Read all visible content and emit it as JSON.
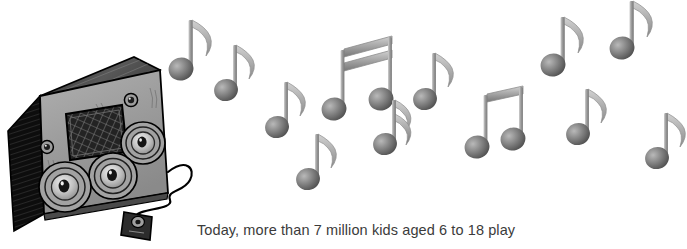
{
  "page": {
    "background_color": "#ffffff",
    "width": 687,
    "height": 249
  },
  "caption": {
    "text": "Today, more than 7 million kids aged 6 to 18 play",
    "color": "#3b3b3b"
  },
  "illustration": {
    "title": "boombox-with-music-notes",
    "style": "grayscale hand-drawn line art",
    "palette": {
      "body": "#9a9a9a",
      "body_dark": "#111111",
      "body_top": "#6f6f6f",
      "outline": "#000000",
      "note": "#8f8f8f",
      "note_head_dark": "#5e5e5e",
      "note_stem": "#a8a8a8",
      "grille": "#2b2b2b",
      "cord": "#000000",
      "mic": "#2a2a2a"
    },
    "boombox": {
      "name": "boombox",
      "speakers": [
        {
          "name": "speaker-left",
          "cx": 65,
          "cy": 186,
          "r": 27
        },
        {
          "name": "speaker-center",
          "cx": 113,
          "cy": 175,
          "r": 25
        },
        {
          "name": "speaker-right",
          "cx": 143,
          "cy": 143,
          "r": 23
        }
      ],
      "knobs": [
        {
          "name": "knob-upper-right",
          "cx": 131,
          "cy": 100,
          "r": 6
        },
        {
          "name": "knob-lower-left",
          "cx": 47,
          "cy": 146,
          "r": 6
        }
      ],
      "grille": {
        "name": "mesh-grille",
        "x": 66,
        "y": 111,
        "w": 54,
        "h": 45
      },
      "cord": {
        "name": "power-cord"
      },
      "microphone": {
        "name": "microphone-plug",
        "cx": 138,
        "cy": 226
      }
    },
    "notes": [
      {
        "name": "note-1",
        "type": "eighth",
        "head_x": 181,
        "head_y": 69,
        "stem_h": 48,
        "scale": 1.0
      },
      {
        "name": "note-2",
        "type": "eighth",
        "head_x": 226,
        "head_y": 90,
        "stem_h": 44,
        "scale": 0.95
      },
      {
        "name": "note-3",
        "type": "eighth",
        "head_x": 277,
        "head_y": 127,
        "stem_h": 45,
        "scale": 0.95
      },
      {
        "name": "note-4",
        "type": "eighth",
        "head_x": 308,
        "head_y": 179,
        "stem_h": 45,
        "scale": 0.95
      },
      {
        "name": "note-5-beam-pair",
        "type": "beamed-sixteenth-pair",
        "head_x": 334,
        "head_y": 108,
        "head2_x": 381,
        "head2_y": 99,
        "stem_h": 62,
        "scale": 1.0
      },
      {
        "name": "note-6",
        "type": "sixteenth",
        "head_x": 385,
        "head_y": 144,
        "stem_h": 48,
        "scale": 0.95
      },
      {
        "name": "note-7",
        "type": "eighth",
        "head_x": 425,
        "head_y": 99,
        "stem_h": 47,
        "scale": 0.95
      },
      {
        "name": "note-8-beam-pair",
        "type": "beamed-eighth-pair",
        "head_x": 477,
        "head_y": 146,
        "head2_x": 513,
        "head2_y": 139,
        "stem_h": 58,
        "scale": 1.0
      },
      {
        "name": "note-9",
        "type": "eighth",
        "head_x": 553,
        "head_y": 65,
        "stem_h": 48,
        "scale": 1.0
      },
      {
        "name": "note-10",
        "type": "eighth",
        "head_x": 622,
        "head_y": 48,
        "stem_h": 49,
        "scale": 1.0
      },
      {
        "name": "note-11",
        "type": "eighth",
        "head_x": 578,
        "head_y": 134,
        "stem_h": 47,
        "scale": 0.95
      },
      {
        "name": "note-12",
        "type": "eighth",
        "head_x": 657,
        "head_y": 158,
        "stem_h": 47,
        "scale": 0.95
      }
    ]
  }
}
